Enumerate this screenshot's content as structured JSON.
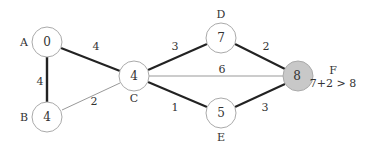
{
  "diagram": {
    "type": "weighted-graph-shortest-path",
    "colors": {
      "bold_edge": "#222222",
      "thin_edge": "#999999",
      "node_stroke": "#aaaaaa",
      "node_fill": "#ffffff",
      "highlight_fill": "#c8c8c8"
    },
    "nodes": [
      {
        "id": "A",
        "label": "A",
        "value": "0"
      },
      {
        "id": "B",
        "label": "B",
        "value": "4"
      },
      {
        "id": "C",
        "label": "C",
        "value": "4"
      },
      {
        "id": "D",
        "label": "D",
        "value": "7"
      },
      {
        "id": "E",
        "label": "E",
        "value": "5"
      },
      {
        "id": "F",
        "label": "F",
        "value": "8",
        "highlighted": true,
        "annotation": "7+2 > 8"
      }
    ],
    "edges": [
      {
        "from": "A",
        "to": "C",
        "weight": "4",
        "bold": true
      },
      {
        "from": "A",
        "to": "B",
        "weight": "4",
        "bold": true
      },
      {
        "from": "B",
        "to": "C",
        "weight": "2",
        "bold": false
      },
      {
        "from": "C",
        "to": "D",
        "weight": "3",
        "bold": true
      },
      {
        "from": "C",
        "to": "F",
        "weight": "6",
        "bold": false
      },
      {
        "from": "C",
        "to": "E",
        "weight": "1",
        "bold": true
      },
      {
        "from": "D",
        "to": "F",
        "weight": "2",
        "bold": true
      },
      {
        "from": "E",
        "to": "F",
        "weight": "3",
        "bold": true
      }
    ]
  }
}
